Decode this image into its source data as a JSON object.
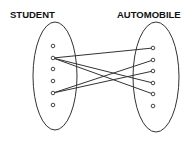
{
  "diagram": {
    "type": "mapping",
    "left_set": {
      "label": "STUDENT",
      "elements": 6
    },
    "right_set": {
      "label": "AUTOMOBILE",
      "elements": 6
    },
    "mappings": [
      {
        "from": 2,
        "to": 1
      },
      {
        "from": 2,
        "to": 4
      },
      {
        "from": 2,
        "to": 5
      },
      {
        "from": 5,
        "to": 2
      },
      {
        "from": 5,
        "to": 3
      }
    ],
    "colors": {
      "stroke": "#333333",
      "background": "#ffffff"
    }
  }
}
